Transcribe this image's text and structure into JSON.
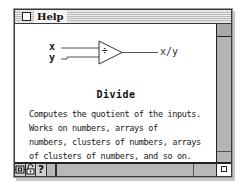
{
  "window": {
    "title": "Help",
    "close_box_icon": "close-box-icon"
  },
  "diagram": {
    "inputs": [
      "x",
      "y"
    ],
    "operator_symbol": "÷",
    "output": "x/y"
  },
  "function": {
    "name": "Divide",
    "description_lines": [
      "Computes the quotient of the inputs.",
      "Works on numbers, arrays of",
      "numbers, clusters of numbers, arrays",
      "of clusters of numbers, and so on."
    ]
  },
  "bottom_bar": {
    "icons": [
      {
        "name": "hierarchy-icon",
        "glyph": "⊞"
      },
      {
        "name": "lock-icon",
        "glyph": "🔓"
      },
      {
        "name": "help-question-icon",
        "glyph": "?"
      }
    ]
  },
  "colors": {
    "frame": "#9a9a9a",
    "scrollbar": "#b4b4b4",
    "text": "#222222",
    "background": "#ffffff"
  }
}
